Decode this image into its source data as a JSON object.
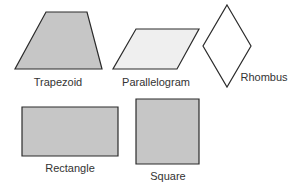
{
  "diagram": {
    "colors": {
      "stroke": "#2b2b2b",
      "fill_gray": "#c6c6c6",
      "fill_light": "#efefef",
      "fill_none": "#ffffff",
      "text": "#333333"
    },
    "shapes": [
      {
        "id": "trapezoid",
        "label": "Trapezoid",
        "points": "46,12 87,12 102,69 15,69",
        "fill": "fill_gray",
        "label_x": 58,
        "label_y": 86
      },
      {
        "id": "parallelogram",
        "label": "Parallelogram",
        "points": "136,29 199,29 177,69 113,69",
        "fill": "fill_light",
        "label_x": 156,
        "label_y": 86
      },
      {
        "id": "rhombus",
        "label": "Rhombus",
        "points": "227,5 251,46 227,87 203,46",
        "fill": "fill_none",
        "label_x": 264,
        "label_y": 81
      },
      {
        "id": "rectangle",
        "label": "Rectangle",
        "points": "22,107 118,107 118,156 22,156",
        "fill": "fill_gray",
        "label_x": 70,
        "label_y": 172
      },
      {
        "id": "square",
        "label": "Square",
        "points": "136,99 199,99 199,164 136,164",
        "fill": "fill_gray",
        "label_x": 168,
        "label_y": 180
      }
    ]
  }
}
